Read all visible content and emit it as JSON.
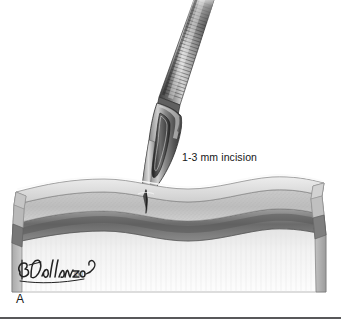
{
  "figure": {
    "domain_kind": "medical-illustration",
    "panel_letter": "A",
    "annotation_label": "1-3 mm incision",
    "signature_name": "B.Dallanzo",
    "signature_credential": "CMI",
    "canvas": {
      "width": 341,
      "height": 319,
      "background": "#ffffff"
    }
  },
  "instrument": {
    "name": "scalpel",
    "handle_name": "scalpel-handle",
    "blade_name": "scalpel-blade",
    "blade_slot_name": "blade-slot",
    "tip_name": "blade-tip",
    "angle_degrees": 20,
    "grip_texture": "knurled-ridges",
    "ridge_count": 34
  },
  "tissue": {
    "block_name": "skin-cross-section",
    "layers": [
      {
        "id": "epidermis",
        "label": "epidermis",
        "color": "#d8d8d8"
      },
      {
        "id": "dermis",
        "label": "dermis",
        "color": "#c3c3c3"
      },
      {
        "id": "dermis-stipple",
        "label": "dermis stipple",
        "color": "#b4b4b4"
      },
      {
        "id": "separator",
        "label": "separator",
        "color": "#fbfbfb"
      },
      {
        "id": "subcutaneous",
        "label": "subcutaneous fat",
        "color": "#8e8e8e"
      },
      {
        "id": "fascia-muscle",
        "label": "fascia / muscle",
        "color": "#6f6f6f"
      },
      {
        "id": "deep-tissue",
        "label": "deep tissue",
        "color": "#efefef"
      }
    ],
    "incision": {
      "name": "incision-cut",
      "color": "#3a3a3a",
      "depth_mm_range": "1-3"
    }
  },
  "palette": {
    "outline": "#2e2e2e",
    "steel_light": "#f2f2f2",
    "steel_mid": "#9a9a9a",
    "steel_dark": "#4a4a4a",
    "steel_darkest": "#2b2b2b",
    "text": "#161616",
    "rule": "#58585a"
  }
}
